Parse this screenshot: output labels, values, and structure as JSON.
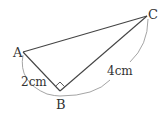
{
  "figure": {
    "vertices": {
      "A": {
        "label": "A",
        "x": 23,
        "y": 52
      },
      "B": {
        "label": "B",
        "x": 60,
        "y": 91
      },
      "C": {
        "label": "C",
        "x": 147,
        "y": 16
      }
    },
    "measurements": {
      "AB": "2cm",
      "BC": "4cm"
    },
    "right_angle_at": "B",
    "colors": {
      "line": "#444444",
      "arc": "#9a9a9a",
      "text": "#333333"
    }
  }
}
